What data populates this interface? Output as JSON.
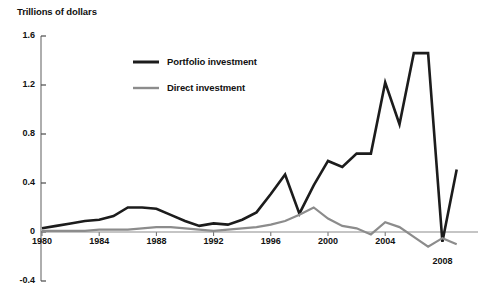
{
  "chart_data": {
    "type": "line",
    "title": "",
    "ylabel": "Trillions of dollars",
    "xlabel": "",
    "ylim": [
      -0.4,
      1.6
    ],
    "xlim": [
      1980,
      2009.5
    ],
    "grid": false,
    "legend_position": "upper-center",
    "y_ticks": [
      "1.6",
      "1.2",
      "0.8",
      "0.4",
      "0",
      "-0.4"
    ],
    "y_tick_values": [
      1.6,
      1.2,
      0.8,
      0.4,
      0,
      -0.4
    ],
    "x_ticks": [
      "1980",
      "1984",
      "1988",
      "1992",
      "1996",
      "2000",
      "2004",
      "2008"
    ],
    "x_tick_values": [
      1980,
      1984,
      1988,
      1992,
      1996,
      2000,
      2004,
      2008
    ],
    "x": [
      1980,
      1981,
      1982,
      1983,
      1984,
      1985,
      1986,
      1987,
      1988,
      1989,
      1990,
      1991,
      1992,
      1993,
      1994,
      1995,
      1996,
      1997,
      1998,
      1999,
      2000,
      2001,
      2002,
      2003,
      2004,
      2005,
      2006,
      2007,
      2008,
      2009
    ],
    "series": [
      {
        "name": "Portfolio investment",
        "color": "#1c1c1c",
        "width": 2.6,
        "values": [
          0.03,
          0.05,
          0.07,
          0.09,
          0.1,
          0.13,
          0.2,
          0.2,
          0.19,
          0.14,
          0.09,
          0.05,
          0.07,
          0.06,
          0.1,
          0.16,
          0.31,
          0.47,
          0.15,
          0.38,
          0.58,
          0.53,
          0.64,
          0.64,
          1.22,
          0.88,
          1.46,
          1.46,
          -0.08,
          0.51
        ]
      },
      {
        "name": "Direct investment",
        "color": "#8c8c8c",
        "width": 2.2,
        "values": [
          0.01,
          0.01,
          0.01,
          0.01,
          0.02,
          0.02,
          0.02,
          0.03,
          0.04,
          0.04,
          0.03,
          0.02,
          0.01,
          0.02,
          0.03,
          0.04,
          0.06,
          0.09,
          0.14,
          0.2,
          0.11,
          0.05,
          0.03,
          -0.02,
          0.08,
          0.04,
          -0.04,
          -0.12,
          -0.05,
          -0.1
        ]
      }
    ]
  },
  "legend": {
    "items": [
      {
        "label": "Portfolio investment",
        "color": "#1c1c1c"
      },
      {
        "label": "Direct investment",
        "color": "#8c8c8c"
      }
    ]
  }
}
